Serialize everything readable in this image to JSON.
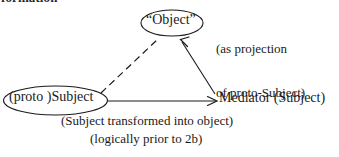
{
  "page": {
    "background_color": "#ffffff",
    "ink_color": "#1a1a1a",
    "width": 339,
    "height": 157
  },
  "cropped_header": {
    "fragment_text": "formation"
  },
  "nodes": {
    "object": {
      "label": "“Object”",
      "shape": "ellipse"
    },
    "subject": {
      "label": "(proto )Subject",
      "shape": "ellipse"
    },
    "mediator": {
      "label": "Mediator (Subject)",
      "shape": "plain-text"
    }
  },
  "annotations": {
    "projection_note_line1": "(as projection",
    "projection_note_line2": "of proto-Subject)",
    "caption_line1": "(Subject transformed into object)",
    "caption_line2": "(logically prior to 2b)"
  },
  "edges": [
    {
      "name": "subject-to-object",
      "style": "dashed",
      "arrowhead": "none"
    },
    {
      "name": "subject-to-mediator",
      "style": "solid",
      "arrowhead": "open-right"
    },
    {
      "name": "mediator-to-object",
      "style": "solid",
      "arrowhead": "open-up-left"
    }
  ]
}
